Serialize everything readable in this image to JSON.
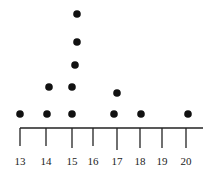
{
  "chart_data": {
    "type": "scatter",
    "subtype": "dot_plot",
    "title": "",
    "xlabel": "",
    "ylabel": "",
    "xlim": [
      13,
      20
    ],
    "x_ticks": [
      13,
      14,
      15,
      16,
      17,
      18,
      19,
      20
    ],
    "x_tick_labels": [
      "13",
      "14",
      "15",
      "16",
      "17",
      "18",
      "19",
      "20"
    ],
    "grid": false,
    "legend": null,
    "categories": [
      13,
      14,
      15,
      16,
      17,
      18,
      19,
      20
    ],
    "values": [
      1,
      2,
      5,
      0,
      2,
      1,
      0,
      1
    ],
    "points": [
      {
        "x": 13,
        "count": 1
      },
      {
        "x": 14,
        "count": 2
      },
      {
        "x": 15,
        "count": 5
      },
      {
        "x": 16,
        "count": 0
      },
      {
        "x": 17,
        "count": 2
      },
      {
        "x": 18,
        "count": 1
      },
      {
        "x": 19,
        "count": 0
      },
      {
        "x": 20,
        "count": 1
      }
    ],
    "dot_color": "#111111",
    "axis_color": "#222222"
  }
}
